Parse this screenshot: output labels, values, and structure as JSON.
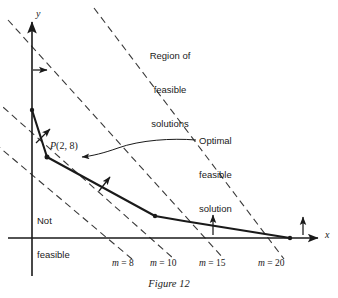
{
  "figure": {
    "caption": "Figure 12",
    "axes": {
      "x_label": "x",
      "y_label": "y",
      "origin_px": [
        32,
        238
      ],
      "x_axis_end_px": [
        322,
        238
      ],
      "y_axis_top_px": [
        32,
        18
      ]
    },
    "annotations": {
      "region_feasible": "Region of\nfeasible\nsolutions",
      "region_feasible_lines": [
        "Region of",
        "feasible",
        "solutions"
      ],
      "not_feasible": "Not\nfeasible",
      "not_feasible_lines": [
        "Not",
        "feasible"
      ],
      "optimal": "Optimal\nfeasible\nsolution",
      "optimal_lines": [
        "Optimal",
        "feasible",
        "solution"
      ],
      "point_label_prefix": "P",
      "point_label_coords": "(2, 8)"
    },
    "objective_lines": [
      {
        "label_prefix": "m",
        "label_eq": " = ",
        "label_value": "8",
        "label_px": [
          117,
          265
        ],
        "p1": [
          -12,
          138
        ],
        "p2": [
          130,
          258
        ]
      },
      {
        "label_prefix": "m",
        "label_eq": " = ",
        "label_value": "10",
        "label_px": [
          152,
          265
        ],
        "p1": [
          -12,
          94
        ],
        "p2": [
          172,
          258
        ]
      },
      {
        "label_prefix": "m",
        "label_eq": " = ",
        "label_value": "15",
        "label_px": [
          202,
          265
        ],
        "p1": [
          10,
          22
        ],
        "p2": [
          222,
          258
        ]
      },
      {
        "label_prefix": "m",
        "label_eq": " = ",
        "label_value": "20",
        "label_px": [
          262,
          265
        ],
        "p1": [
          96,
          10
        ],
        "p2": [
          282,
          258
        ]
      }
    ],
    "feasible_boundary": {
      "vertices_px": [
        [
          32,
          110
        ],
        [
          47,
          157
        ],
        [
          155,
          216
        ],
        [
          184,
          221
        ],
        [
          290,
          238
        ]
      ],
      "marked_vertices_px": [
        [
          32,
          110
        ],
        [
          47,
          157
        ],
        [
          155,
          216
        ],
        [
          290,
          238
        ]
      ],
      "named_vertex": {
        "name": "P",
        "coords": "(2, 8)",
        "px": [
          47,
          157
        ]
      }
    },
    "direction_arrows": [
      {
        "type": "arrow-right",
        "from_px": [
          33,
          70
        ],
        "to_px": [
          49,
          70
        ]
      },
      {
        "type": "arrow-up-right",
        "from_px": [
          36,
          142
        ],
        "to_px": [
          50,
          128
        ]
      },
      {
        "type": "arrow-up-right",
        "from_px": [
          100,
          190
        ],
        "to_px": [
          110,
          176
        ]
      },
      {
        "type": "arrow-up",
        "from_px": [
          213,
          234
        ],
        "to_px": [
          213,
          214
        ]
      },
      {
        "type": "arrow-up",
        "from_px": [
          303,
          234
        ],
        "to_px": [
          303,
          216
        ]
      }
    ],
    "leader": {
      "from_text_px": [
        196,
        142
      ],
      "to_point_px": [
        80,
        157
      ]
    },
    "colors": {
      "ink": "#1a1a1a",
      "dash": "#3a3a3a",
      "background": "#ffffff"
    }
  }
}
